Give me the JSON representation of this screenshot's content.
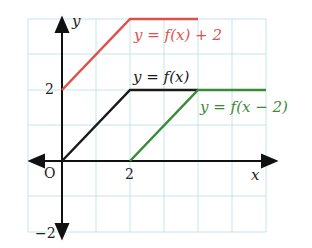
{
  "diagram": {
    "axes": {
      "x_label": "x",
      "y_label": "y",
      "origin_label": "O"
    },
    "ticks": {
      "x": [
        "2"
      ],
      "y": [
        "2",
        "−2"
      ]
    },
    "curves": [
      {
        "name": "f(x)+2",
        "label": "y = f(x) + 2",
        "color": "#e0504a",
        "points": [
          [
            0,
            2
          ],
          [
            2,
            4
          ],
          [
            4,
            4
          ]
        ]
      },
      {
        "name": "f(x)",
        "label": "y = f(x)",
        "color": "#1a1a1a",
        "points": [
          [
            0,
            0
          ],
          [
            2,
            2
          ],
          [
            4,
            2
          ]
        ]
      },
      {
        "name": "f(x-2)",
        "label": "y = f(x − 2)",
        "color": "#3a8a3a",
        "points": [
          [
            2,
            0
          ],
          [
            4,
            2
          ],
          [
            6,
            2
          ]
        ]
      }
    ],
    "grid_color": "#bfe3ea"
  }
}
